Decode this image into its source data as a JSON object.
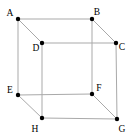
{
  "diagram": {
    "type": "cube-wireframe",
    "width": 130,
    "height": 136,
    "background": "#ffffff",
    "edge_color": "#a9a9a9",
    "edge_width": 1,
    "vertex_color": "#000000",
    "vertex_radius": 2.2,
    "label_color": "#000000",
    "vertices": [
      {
        "id": "A",
        "x": 18,
        "y": 19,
        "label_x": 10,
        "label_y": 13
      },
      {
        "id": "B",
        "x": 92,
        "y": 19,
        "label_x": 97,
        "label_y": 12
      },
      {
        "id": "C",
        "x": 116,
        "y": 43,
        "label_x": 122,
        "label_y": 47
      },
      {
        "id": "D",
        "x": 42,
        "y": 43,
        "label_x": 36,
        "label_y": 48
      },
      {
        "id": "E",
        "x": 18,
        "y": 95,
        "label_x": 10,
        "label_y": 90
      },
      {
        "id": "F",
        "x": 92,
        "y": 94,
        "label_x": 99,
        "label_y": 88
      },
      {
        "id": "G",
        "x": 117,
        "y": 119,
        "label_x": 122,
        "label_y": 129
      },
      {
        "id": "H",
        "x": 42,
        "y": 118,
        "label_x": 35,
        "label_y": 129
      }
    ],
    "edges": [
      [
        "A",
        "B"
      ],
      [
        "A",
        "D"
      ],
      [
        "A",
        "E"
      ],
      [
        "B",
        "C"
      ],
      [
        "B",
        "F"
      ],
      [
        "C",
        "D"
      ],
      [
        "C",
        "G"
      ],
      [
        "D",
        "H"
      ],
      [
        "E",
        "F"
      ],
      [
        "E",
        "H"
      ],
      [
        "F",
        "G"
      ],
      [
        "G",
        "H"
      ]
    ]
  }
}
